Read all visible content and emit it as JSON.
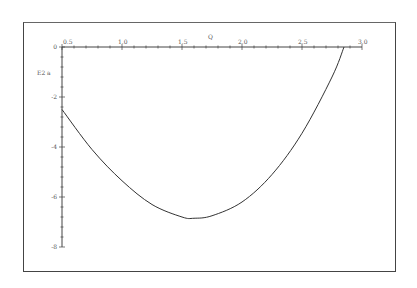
{
  "chart_data": {
    "type": "line",
    "title": "",
    "xlabel": "Q",
    "ylabel": "E2 a",
    "x_ticks": [
      "0.5",
      "1.0",
      "1.5",
      "2.0",
      "2.5",
      "3.0"
    ],
    "y_ticks": [
      "0",
      "-2",
      "-4",
      "-6",
      "-8"
    ],
    "xlim": [
      0.5,
      3.0
    ],
    "ylim": [
      -8,
      0
    ],
    "grid": false,
    "legend": null,
    "series": [
      {
        "name": "E2 a",
        "x": [
          0.5,
          0.75,
          1.0,
          1.25,
          1.5,
          1.6,
          1.75,
          2.0,
          2.25,
          2.5,
          2.75,
          2.85
        ],
        "y": [
          -2.5,
          -4.1,
          -5.35,
          -6.3,
          -6.8,
          -6.85,
          -6.75,
          -6.2,
          -5.1,
          -3.45,
          -1.2,
          0.0
        ]
      }
    ],
    "line_color": "#333333"
  }
}
